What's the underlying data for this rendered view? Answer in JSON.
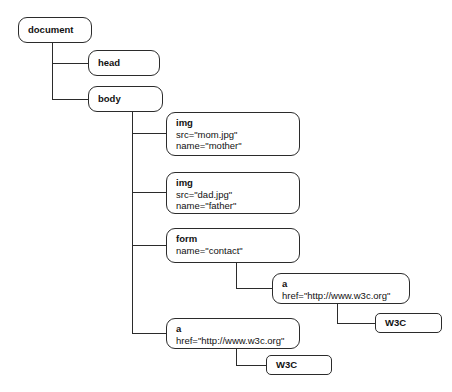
{
  "diagram": {
    "type": "dom-tree",
    "background_color": "#ffffff",
    "box_border_color": "#2b2b2b",
    "text_color": "#111111",
    "connector_color": "#2b2b2b",
    "nodes": [
      {
        "id": "document",
        "tag": "document",
        "attrs": [],
        "kind": "element",
        "box": {
          "x": 18,
          "y": 17,
          "w": 74,
          "h": 26
        }
      },
      {
        "id": "head",
        "tag": "head",
        "attrs": [],
        "kind": "element",
        "box": {
          "x": 88,
          "y": 50,
          "w": 72,
          "h": 26
        }
      },
      {
        "id": "body",
        "tag": "body",
        "attrs": [],
        "kind": "element",
        "box": {
          "x": 88,
          "y": 86,
          "w": 75,
          "h": 26
        }
      },
      {
        "id": "img-mother",
        "tag": "img",
        "attrs": [
          "src=\"mom.jpg\"",
          "name=\"mother\""
        ],
        "kind": "element",
        "box": {
          "x": 166,
          "y": 112,
          "w": 134,
          "h": 44
        }
      },
      {
        "id": "img-father",
        "tag": "img",
        "attrs": [
          "src=\"dad.jpg\"",
          "name=\"father\""
        ],
        "kind": "element",
        "box": {
          "x": 166,
          "y": 172,
          "w": 134,
          "h": 42
        }
      },
      {
        "id": "form-contact",
        "tag": "form",
        "attrs": [
          "name=\"contact\""
        ],
        "kind": "element",
        "box": {
          "x": 166,
          "y": 228,
          "w": 134,
          "h": 35
        }
      },
      {
        "id": "anchor-form",
        "tag": "a",
        "attrs": [
          "href=\"http://www.w3c.org\""
        ],
        "kind": "element",
        "box": {
          "x": 272,
          "y": 273,
          "w": 138,
          "h": 31
        }
      },
      {
        "id": "text-w3c-form",
        "tag": "W3C",
        "attrs": [],
        "kind": "text",
        "box": {
          "x": 375,
          "y": 313,
          "w": 67,
          "h": 20
        }
      },
      {
        "id": "anchor-body",
        "tag": "a",
        "attrs": [
          "href=\"http://www.w3c.org\""
        ],
        "kind": "element",
        "box": {
          "x": 166,
          "y": 318,
          "w": 134,
          "h": 31
        }
      },
      {
        "id": "text-w3c-body",
        "tag": "W3C",
        "attrs": [],
        "kind": "text",
        "box": {
          "x": 266,
          "y": 355,
          "w": 66,
          "h": 20
        }
      }
    ],
    "edges": [
      {
        "from": "document",
        "to": "head"
      },
      {
        "from": "document",
        "to": "body"
      },
      {
        "from": "body",
        "to": "img-mother"
      },
      {
        "from": "body",
        "to": "img-father"
      },
      {
        "from": "body",
        "to": "form-contact"
      },
      {
        "from": "body",
        "to": "anchor-body"
      },
      {
        "from": "form-contact",
        "to": "anchor-form"
      },
      {
        "from": "anchor-form",
        "to": "text-w3c-form"
      },
      {
        "from": "anchor-body",
        "to": "text-w3c-body"
      }
    ]
  }
}
